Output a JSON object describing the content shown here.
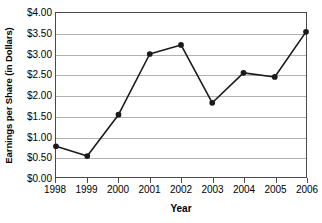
{
  "chart_data": {
    "type": "line",
    "title": "",
    "xlabel": "Year",
    "ylabel": "Earnings per Share (in Dollars)",
    "categories": [
      "1998",
      "1999",
      "2000",
      "2001",
      "2002",
      "2003",
      "2004",
      "2005",
      "2006"
    ],
    "values": [
      0.75,
      0.51,
      1.52,
      3.0,
      3.22,
      1.81,
      2.54,
      2.44,
      3.54
    ],
    "series": [
      {
        "name": "Earnings per Share",
        "values": [
          0.75,
          0.51,
          1.52,
          3.0,
          3.22,
          1.81,
          2.54,
          2.44,
          3.54
        ]
      }
    ],
    "ylim": [
      0.0,
      4.0
    ],
    "ytick_values": [
      0.0,
      0.5,
      1.0,
      1.5,
      2.0,
      2.5,
      3.0,
      3.5,
      4.0
    ],
    "ytick_labels": [
      "$0.00",
      "$0.50",
      "$1.00",
      "$1.50",
      "$2.00",
      "$2.50",
      "$3.00",
      "$3.50",
      "$4.00"
    ],
    "grid": true,
    "grid_axis": "y",
    "legend": false,
    "legend_position": "none",
    "marker": "filled-circle",
    "line_color": "#1a1a1a",
    "marker_color": "#1a1a1a",
    "grid_color": "#b0b0b0",
    "axis_color": "#4a4a4a",
    "background_color": "#ffffff"
  }
}
